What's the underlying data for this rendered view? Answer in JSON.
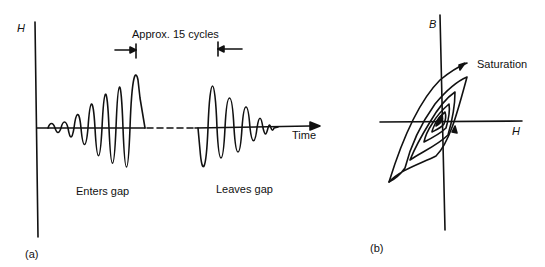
{
  "panel_a": {
    "caption": "(a)",
    "y_axis_label": "H",
    "x_axis_label": "Time",
    "annotation": "Approx. 15 cycles",
    "enters_label": "Enters gap",
    "leaves_label": "Leaves gap"
  },
  "panel_b": {
    "caption": "(b)",
    "y_axis_label": "B",
    "x_axis_label": "H",
    "annotation": "Saturation"
  },
  "colors": {
    "line": "#111111",
    "background": "#ffffff"
  }
}
